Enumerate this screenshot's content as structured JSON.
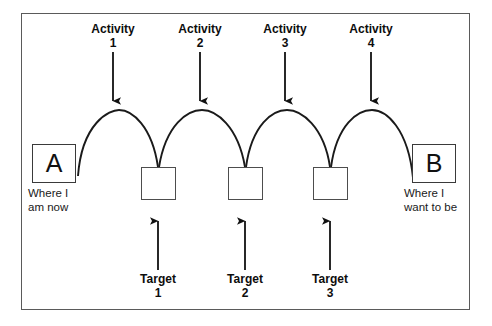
{
  "diagram": {
    "frame": {
      "border_color": "#5a5a5a"
    },
    "endpoints": [
      {
        "id": "A",
        "letter": "A",
        "caption": "Where I\nam now",
        "x": 32,
        "y": 144,
        "caption_x": 28,
        "caption_y": 188
      },
      {
        "id": "B",
        "letter": "B",
        "caption": "Where I\nwant to be",
        "x": 412,
        "y": 144,
        "caption_x": 404,
        "caption_y": 188
      }
    ],
    "targets": [
      {
        "id": "target-1",
        "label_line1": "Target",
        "label_line2": "1",
        "box_x": 141,
        "box_y": 167,
        "arrow_x": 158,
        "arrow_top": 212,
        "arrow_bottom": 270,
        "label_x": 123,
        "label_y": 273
      },
      {
        "id": "target-2",
        "label_line1": "Target",
        "label_line2": "2",
        "box_x": 228,
        "box_y": 167,
        "arrow_x": 245,
        "arrow_top": 212,
        "arrow_bottom": 270,
        "label_x": 210,
        "label_y": 273
      },
      {
        "id": "target-3",
        "label_line1": "Target",
        "label_line2": "3",
        "box_x": 313,
        "box_y": 167,
        "arrow_x": 330,
        "arrow_top": 212,
        "arrow_bottom": 270,
        "label_x": 295,
        "label_y": 273
      }
    ],
    "activities": [
      {
        "id": "activity-1",
        "label_line1": "Activity",
        "label_line2": "1",
        "arrow_x": 113,
        "arrow_top": 52,
        "arrow_bottom": 110,
        "label_x": 78,
        "label_y": 22
      },
      {
        "id": "activity-2",
        "label_line1": "Activity",
        "label_line2": "2",
        "arrow_x": 200,
        "arrow_top": 52,
        "arrow_bottom": 110,
        "label_x": 165,
        "label_y": 22
      },
      {
        "id": "activity-3",
        "label_line1": "Activity",
        "label_line2": "3",
        "arrow_x": 285,
        "arrow_top": 52,
        "arrow_bottom": 110,
        "label_x": 250,
        "label_y": 22
      },
      {
        "id": "activity-4",
        "label_line1": "Activity",
        "label_line2": "4",
        "arrow_x": 371,
        "arrow_top": 52,
        "arrow_bottom": 110,
        "label_x": 336,
        "label_y": 22
      }
    ],
    "arcs": [
      {
        "id": "arc-1",
        "from_x": 77,
        "from_y": 170,
        "to_x": 158,
        "to_y": 167,
        "peak_y": 114
      },
      {
        "id": "arc-2",
        "from_x": 158,
        "from_y": 167,
        "to_x": 245,
        "to_y": 167,
        "peak_y": 114
      },
      {
        "id": "arc-3",
        "from_x": 245,
        "from_y": 167,
        "to_x": 330,
        "to_y": 167,
        "peak_y": 114
      },
      {
        "id": "arc-4",
        "from_x": 330,
        "from_y": 167,
        "to_x": 412,
        "to_y": 170,
        "peak_y": 114
      }
    ],
    "colors": {
      "stroke": "#1a1a1a",
      "frame": "#5a5a5a",
      "box": "#4a4a4a",
      "text": "#111111",
      "background": "#ffffff"
    }
  }
}
